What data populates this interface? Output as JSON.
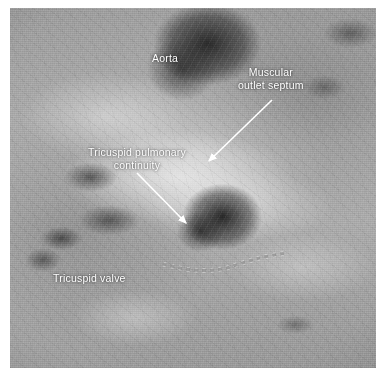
{
  "figure": {
    "type": "anatomical-photograph",
    "background_color": "#ffffff",
    "photo": {
      "x": 10,
      "y": 8,
      "width": 366,
      "height": 360,
      "tone": "grayscale",
      "dominant_colors": [
        "#9c9c9c",
        "#b4b4b4",
        "#2a2a2a",
        "#e6e6e6"
      ]
    }
  },
  "annotations": {
    "label_color": "#ffffff",
    "arrow_color": "#ffffff",
    "labels": [
      {
        "id": "aorta",
        "text": "Aorta",
        "x": 152,
        "y": 52,
        "align": "left",
        "lines": [
          "Aorta"
        ]
      },
      {
        "id": "muscular-outlet-septum",
        "text": "Muscular\noutlet septum",
        "x": 238,
        "y": 66,
        "align": "center",
        "lines": [
          "Muscular",
          "outlet septum"
        ]
      },
      {
        "id": "tricuspid-pulmonary-continuity",
        "text": "Tricuspid pulmonary\ncontinuity",
        "x": 88,
        "y": 146,
        "align": "center",
        "lines": [
          "Tricuspid pulmonary",
          "continuity"
        ]
      },
      {
        "id": "tricuspid-valve",
        "text": "Tricuspid valve",
        "x": 53,
        "y": 272,
        "align": "left",
        "lines": [
          "Tricuspid valve"
        ]
      }
    ],
    "arrows": [
      {
        "id": "arrow-muscular-outlet-septum",
        "from": [
          272,
          100
        ],
        "to": [
          209,
          161
        ],
        "points_to": "muscular outlet septum"
      },
      {
        "id": "arrow-tricuspid-pulmonary-continuity",
        "from": [
          137,
          173
        ],
        "to": [
          186,
          223
        ],
        "points_to": "tricuspid pulmonary continuity"
      }
    ],
    "dotted_marker": {
      "id": "tricuspid-valve-hinge-line",
      "style": "square-dashed-curve",
      "color": "#3a3a3a",
      "path": "M 163,264 Q 205,276 233,266 Q 262,256 287,253",
      "dash": "3 5"
    }
  }
}
